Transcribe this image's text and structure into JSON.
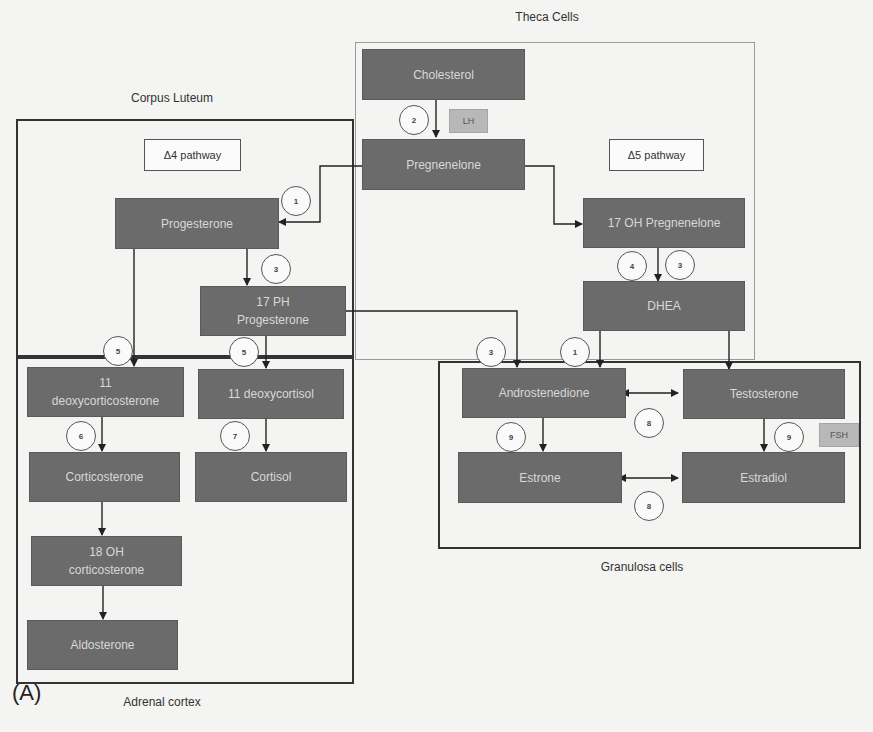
{
  "regions": {
    "theca": {
      "label": "Theca Cells"
    },
    "corpus_luteum": {
      "label": "Corpus Luteum"
    },
    "adrenal": {
      "label": "Adrenal cortex"
    },
    "granulosa": {
      "label": "Granulosa cells"
    }
  },
  "pathways": {
    "delta4": "Δ4 pathway",
    "delta5": "Δ5 pathway"
  },
  "hormones": {
    "lh": "LH",
    "fsh": "FSH"
  },
  "nodes": {
    "cholesterol": "Cholesterol",
    "pregnenolone": "Pregnenelone",
    "oh17_pregnenolone": "17 OH Pregnenelone",
    "dhea": "DHEA",
    "progesterone": "Progesterone",
    "ph17_progesterone_l1": "17 PH",
    "ph17_progesterone_l2": "Progesterone",
    "deoxycorticosterone_l1": "11",
    "deoxycorticosterone_l2": "deoxycorticosterone",
    "deoxycortisol": "11 deoxycortisol",
    "corticosterone": "Corticosterone",
    "cortisol": "Cortisol",
    "oh18_corticosterone_l1": "18 OH",
    "oh18_corticosterone_l2": "corticosterone",
    "aldosterone": "Aldosterone",
    "androstenedione": "Androstenedione",
    "testosterone": "Testosterone",
    "estrone": "Estrone",
    "estradiol": "Estradiol"
  },
  "enzymes": {
    "chol_preg": "2",
    "preg_prog": "1",
    "prog_17ph": "3",
    "oh17preg_dhea_a": "4",
    "oh17preg_dhea_b": "3",
    "prog_doc": "5",
    "ph17_dcort": "5",
    "doc_cort": "6",
    "dcort_cortisol": "7",
    "ph17_andro": "3",
    "dhea_andro": "1",
    "andro_testo": "8",
    "andro_estrone": "9",
    "testo_estradiol": "9",
    "estrone_estradiol": "8"
  },
  "panel_label": "(A)"
}
